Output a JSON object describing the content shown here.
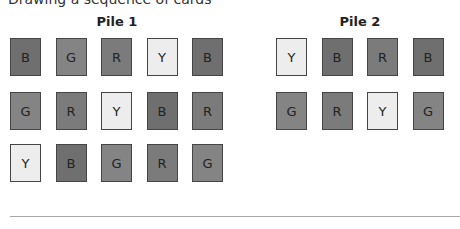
{
  "header": {
    "cutoff_text": "Drawing a sequence of cards"
  },
  "colors": {
    "B": "#6f6f6f",
    "G": "#848484",
    "R": "#7b7b7b",
    "Y": "#ededed",
    "border": "#454545"
  },
  "piles": [
    {
      "title": "Pile 1",
      "rows": [
        [
          "B",
          "G",
          "R",
          "Y",
          "B"
        ],
        [
          "G",
          "R",
          "Y",
          "B",
          "R"
        ],
        [
          "Y",
          "B",
          "G",
          "R",
          "G"
        ]
      ]
    },
    {
      "title": "Pile 2",
      "rows": [
        [
          "Y",
          "B",
          "R",
          "B"
        ],
        [
          "G",
          "R",
          "Y",
          "G"
        ]
      ]
    }
  ]
}
